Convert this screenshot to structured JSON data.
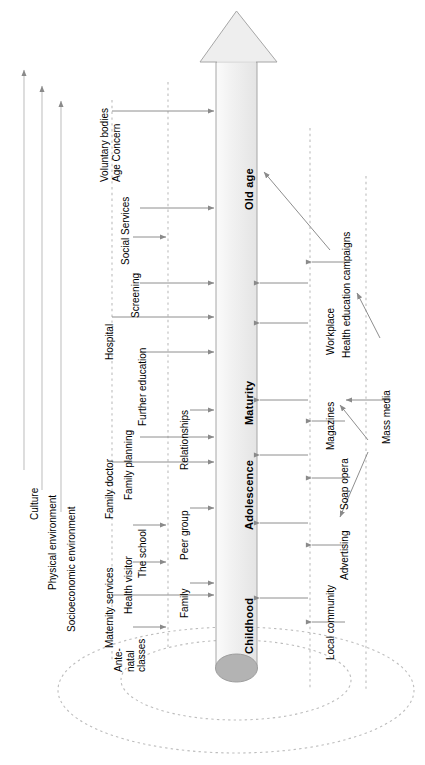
{
  "diagram": {
    "orientation": "rotated-90",
    "colors": {
      "arrow_fill": "#eeeeee",
      "arrow_stroke": "#9a9a9a",
      "base_ellipse_fill": "#b0b0b0",
      "dashed_stroke": "#b5b5b5",
      "connector_stroke": "#8a8a8a",
      "text": "#000000"
    },
    "life_stages": [
      {
        "label": "Childhood"
      },
      {
        "label": "Adolescence"
      },
      {
        "label": "Maturity"
      },
      {
        "label": "Old age"
      }
    ],
    "environment_axes": [
      {
        "label": "Culture"
      },
      {
        "label": "Physical environment"
      },
      {
        "label": "Socioeconomic environment"
      }
    ],
    "inner_ring_nodes": [
      {
        "label": "Family"
      },
      {
        "label": "Peer group"
      },
      {
        "label": "Relationships"
      }
    ],
    "service_nodes": [
      {
        "label": "Ante-\nnatal\nclasses"
      },
      {
        "label": "Health visitor"
      },
      {
        "label": "The school"
      },
      {
        "label": "Family planning"
      },
      {
        "label": "Further education"
      },
      {
        "label": "Screening"
      },
      {
        "label": "Social Services"
      }
    ],
    "outer_service_nodes": [
      {
        "label": "Maternity services"
      },
      {
        "label": "Family doctor"
      },
      {
        "label": "Hospital"
      },
      {
        "label": "Voluntary bodies\nAge Concern"
      }
    ],
    "community_nodes": [
      {
        "label": "Local community"
      },
      {
        "label": "Advertising"
      },
      {
        "label": "Soap opera"
      },
      {
        "label": "Magazines"
      },
      {
        "label": "Workplace"
      },
      {
        "label": "Health education campaigns"
      }
    ],
    "source_nodes": [
      {
        "label": "Mass media"
      }
    ]
  }
}
